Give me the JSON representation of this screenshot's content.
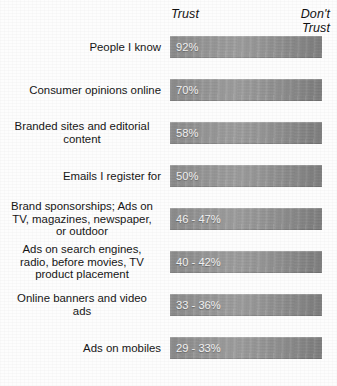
{
  "header": {
    "trust_label": "Trust",
    "dont_trust_label": "Don't\nTrust"
  },
  "chart_data": {
    "type": "bar",
    "title": "",
    "subtitle": "",
    "xlabel": "",
    "ylabel": "",
    "orientation": "horizontal",
    "grid": false,
    "legend": "none",
    "axis_endpoints": [
      "Trust",
      "Don't Trust"
    ],
    "value_format": "percent",
    "note": "All bars are drawn at uniform length; the printed percentage at the left of each bar is the data value.",
    "categories": [
      "People I know",
      "Consumer opinions online",
      "Branded sites and editorial content",
      "Emails I register for",
      "Brand sponsorships; Ads on TV, magazines, newspaper, or outdoor",
      "Ads on search engines, radio, before movies, TV product placement",
      "Online banners and video ads",
      "Ads on mobiles"
    ],
    "value_labels": [
      "92%",
      "70%",
      "58%",
      "50%",
      "46 - 47%",
      "40 - 42%",
      "33 - 36%",
      "29 - 33%"
    ],
    "values": [
      92,
      70,
      58,
      50,
      46.5,
      41,
      34.5,
      31
    ],
    "value_ranges": [
      [
        92,
        92
      ],
      [
        70,
        70
      ],
      [
        58,
        58
      ],
      [
        50,
        50
      ],
      [
        46,
        47
      ],
      [
        40,
        42
      ],
      [
        33,
        36
      ],
      [
        29,
        33
      ]
    ],
    "ylim": [
      0,
      100
    ]
  },
  "rows": [
    {
      "label_lines": [
        "People I know"
      ],
      "value": "92%"
    },
    {
      "label_lines": [
        "Consumer opinions online"
      ],
      "value": "70%"
    },
    {
      "label_lines": [
        "Branded sites and editorial",
        "content"
      ],
      "value": "58%"
    },
    {
      "label_lines": [
        "Emails I register for"
      ],
      "value": "50%"
    },
    {
      "label_lines": [
        "Brand sponsorships; Ads on",
        "TV, magazines, newspaper,",
        "or outdoor"
      ],
      "value": "46 - 47%"
    },
    {
      "label_lines": [
        "Ads on search engines,",
        "radio, before movies, TV",
        "product placement"
      ],
      "value": "40 - 42%"
    },
    {
      "label_lines": [
        "Online banners and video",
        "ads"
      ],
      "value": "33 - 36%"
    },
    {
      "label_lines": [
        "Ads on mobiles"
      ],
      "value": "29 - 33%"
    }
  ],
  "colors": {
    "background": "#fdfdfd",
    "bar_gradient_start": "#8c8c8c",
    "bar_gradient_mid": "#9d9d9d",
    "bar_gradient_end": "#7e7e7e",
    "value_text": "#f2f2f2",
    "label_text": "#161616"
  }
}
